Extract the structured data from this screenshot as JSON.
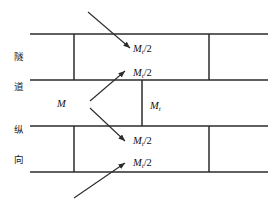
{
  "figure": {
    "type": "diagram",
    "background_color": "#ffffff",
    "line_color": "#2b2b2b",
    "text_color": "#111111"
  },
  "row_labels": [
    {
      "text": "隧",
      "meaning": "tunnel-char-1"
    },
    {
      "text": "道",
      "meaning": "tunnel-char-2"
    },
    {
      "text": "纵",
      "meaning": "longitudinal-char-1"
    },
    {
      "text": "向",
      "meaning": "longitudinal-char-2"
    }
  ],
  "labels": {
    "moment_source": {
      "base": "M",
      "sub": "",
      "suffix": ""
    },
    "moment_half_top_outer": {
      "base": "M",
      "sub": "t",
      "suffix": "/2"
    },
    "moment_half_top_inner": {
      "base": "M",
      "sub": "t",
      "suffix": "/2"
    },
    "moment_center": {
      "base": "M",
      "sub": "t",
      "suffix": ""
    },
    "moment_half_bottom_inner": {
      "base": "M",
      "sub": "t",
      "suffix": "/2"
    },
    "moment_half_bottom_outer": {
      "base": "M",
      "sub": "t",
      "suffix": "/2"
    }
  },
  "geometry": {
    "horizontal_lines_y": [
      34,
      80,
      126,
      172
    ],
    "horizontal_line_x_start": 30,
    "horizontal_line_x_end": 268,
    "vertical_left_x": 74,
    "vertical_right_x": 209,
    "vertical_center_x": 142,
    "bands": [
      {
        "name": "top-band",
        "y_top": 34,
        "y_bottom": 80,
        "verticals": [
          "left",
          "right"
        ]
      },
      {
        "name": "middle-band",
        "y_top": 80,
        "y_bottom": 126,
        "verticals": [
          "center"
        ]
      },
      {
        "name": "bottom-band",
        "y_top": 126,
        "y_bottom": 172,
        "verticals": [
          "left",
          "right"
        ]
      }
    ]
  },
  "arrows": [
    {
      "name": "external-load-arrow-top",
      "from": [
        88,
        12
      ],
      "to": [
        131,
        49
      ],
      "direction": "down-right"
    },
    {
      "name": "moment-split-arrow-up",
      "from": [
        90,
        101
      ],
      "to": [
        126,
        71
      ],
      "direction": "up-right"
    },
    {
      "name": "moment-split-arrow-down",
      "from": [
        90,
        108
      ],
      "to": [
        126,
        142
      ],
      "direction": "down-right"
    },
    {
      "name": "external-load-arrow-bottom",
      "from": [
        74,
        198
      ],
      "to": [
        126,
        163
      ],
      "direction": "up-right"
    }
  ]
}
